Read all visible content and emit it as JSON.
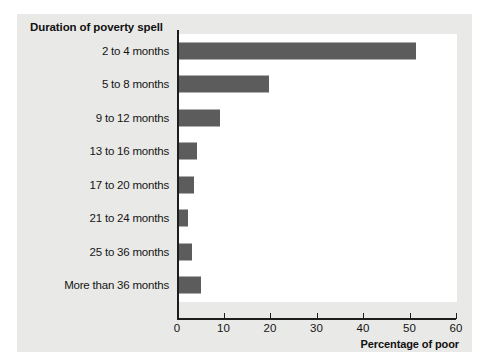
{
  "chart_data": {
    "type": "bar",
    "orientation": "horizontal",
    "title": "Duration of poverty spell",
    "xlabel": "Percentage of poor",
    "ylabel": "",
    "categories": [
      "2 to 4 months",
      "5 to 8 months",
      "9 to 12 months",
      "13 to 16 months",
      "17 to 20 months",
      "21 to 24 months",
      "25 to 36 months",
      "More than 36 months"
    ],
    "values": [
      51.5,
      19.8,
      9.3,
      4.3,
      3.7,
      2.4,
      3.3,
      5.2
    ],
    "xlim": [
      0,
      60
    ],
    "xticks": [
      0,
      10,
      20,
      30,
      40,
      50,
      60
    ],
    "xtick_labels": [
      "0",
      "10",
      "20",
      "30",
      "40",
      "50",
      "60"
    ],
    "grid": false,
    "legend": false,
    "bar_color": "#5c5c5c",
    "panel_color": "#e9e9e7",
    "plot_background": "#ffffff",
    "axis_color": "#1d1d1d"
  }
}
